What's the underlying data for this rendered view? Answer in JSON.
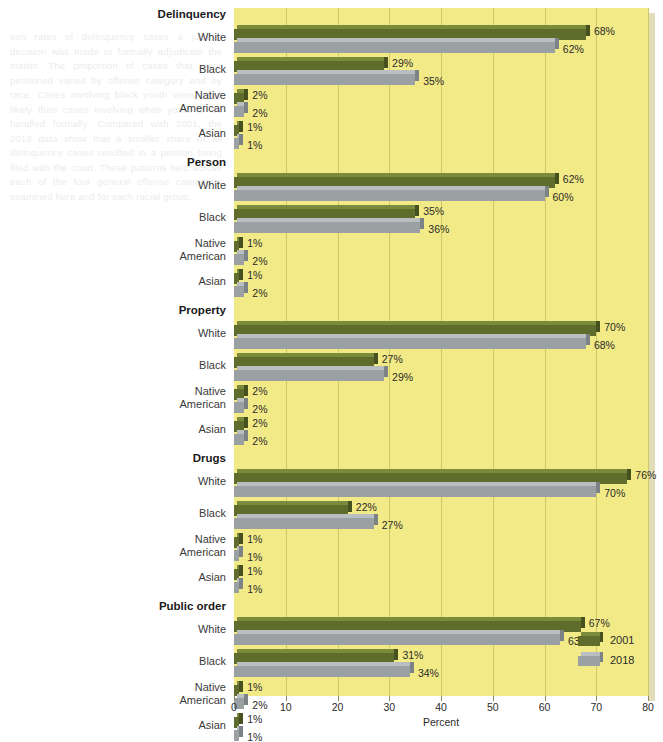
{
  "chart_data": {
    "type": "bar",
    "orientation": "horizontal",
    "title": "",
    "xlabel": "Percent",
    "ylabel": "",
    "xlim": [
      0,
      80
    ],
    "xticks": [
      0,
      10,
      20,
      30,
      40,
      50,
      60,
      70,
      80
    ],
    "xtick_labels": [
      "0",
      "10",
      "20",
      "30",
      "40",
      "50",
      "60",
      "70",
      "80"
    ],
    "grid": true,
    "grid_axis": "x",
    "legend_position": "bottom-right",
    "value_suffix": "%",
    "plot_background": "#f2ea86",
    "series": [
      {
        "name": "2001",
        "color": "#606c2b"
      },
      {
        "name": "2018",
        "color": "#9ba0a3"
      }
    ],
    "groups": [
      {
        "label": "Delinquency",
        "categories": [
          {
            "label": "White",
            "label_lines": [
              "White"
            ],
            "values": [
              68,
              62
            ],
            "value_labels": [
              "68%",
              "62%"
            ]
          },
          {
            "label": "Black",
            "label_lines": [
              "Black"
            ],
            "values": [
              29,
              35
            ],
            "value_labels": [
              "29%",
              "35%"
            ]
          },
          {
            "label": "Native American",
            "label_lines": [
              "Native",
              "American"
            ],
            "values": [
              2,
              2
            ],
            "value_labels": [
              "2%",
              "2%"
            ]
          },
          {
            "label": "Asian",
            "label_lines": [
              "Asian"
            ],
            "values": [
              1,
              1
            ],
            "value_labels": [
              "1%",
              "1%"
            ]
          }
        ]
      },
      {
        "label": "Person",
        "categories": [
          {
            "label": "White",
            "label_lines": [
              "White"
            ],
            "values": [
              62,
              60
            ],
            "value_labels": [
              "62%",
              "60%"
            ]
          },
          {
            "label": "Black",
            "label_lines": [
              "Black"
            ],
            "values": [
              35,
              36
            ],
            "value_labels": [
              "35%",
              "36%"
            ]
          },
          {
            "label": "Native American",
            "label_lines": [
              "Native",
              "American"
            ],
            "values": [
              1,
              2
            ],
            "value_labels": [
              "1%",
              "2%"
            ]
          },
          {
            "label": "Asian",
            "label_lines": [
              "Asian"
            ],
            "values": [
              1,
              2
            ],
            "value_labels": [
              "1%",
              "2%"
            ]
          }
        ]
      },
      {
        "label": "Property",
        "categories": [
          {
            "label": "White",
            "label_lines": [
              "White"
            ],
            "values": [
              70,
              68
            ],
            "value_labels": [
              "70%",
              "68%"
            ]
          },
          {
            "label": "Black",
            "label_lines": [
              "Black"
            ],
            "values": [
              27,
              29
            ],
            "value_labels": [
              "27%",
              "29%"
            ]
          },
          {
            "label": "Native American",
            "label_lines": [
              "Native",
              "American"
            ],
            "values": [
              2,
              2
            ],
            "value_labels": [
              "2%",
              "2%"
            ]
          },
          {
            "label": "Asian",
            "label_lines": [
              "Asian"
            ],
            "values": [
              2,
              2
            ],
            "value_labels": [
              "2%",
              "2%"
            ]
          }
        ]
      },
      {
        "label": "Drugs",
        "categories": [
          {
            "label": "White",
            "label_lines": [
              "White"
            ],
            "values": [
              76,
              70
            ],
            "value_labels": [
              "76%",
              "70%"
            ]
          },
          {
            "label": "Black",
            "label_lines": [
              "Black"
            ],
            "values": [
              22,
              27
            ],
            "value_labels": [
              "22%",
              "27%"
            ]
          },
          {
            "label": "Native American",
            "label_lines": [
              "Native",
              "American"
            ],
            "values": [
              1,
              1
            ],
            "value_labels": [
              "1%",
              "1%"
            ]
          },
          {
            "label": "Asian",
            "label_lines": [
              "Asian"
            ],
            "values": [
              1,
              1
            ],
            "value_labels": [
              "1%",
              "1%"
            ]
          }
        ]
      },
      {
        "label": "Public order",
        "categories": [
          {
            "label": "White",
            "label_lines": [
              "White"
            ],
            "values": [
              67,
              63
            ],
            "value_labels": [
              "67%",
              "63%"
            ]
          },
          {
            "label": "Black",
            "label_lines": [
              "Black"
            ],
            "values": [
              31,
              34
            ],
            "value_labels": [
              "31%",
              "34%"
            ]
          },
          {
            "label": "Native American",
            "label_lines": [
              "Native",
              "American"
            ],
            "values": [
              1,
              2
            ],
            "value_labels": [
              "1%",
              "2%"
            ]
          },
          {
            "label": "Asian",
            "label_lines": [
              "Asian"
            ],
            "values": [
              1,
              1
            ],
            "value_labels": [
              "1%",
              "1%"
            ]
          }
        ]
      }
    ]
  },
  "legend": {
    "entries": [
      {
        "label": "2001",
        "color": "#606c2b"
      },
      {
        "label": "2018",
        "color": "#9ba0a3"
      }
    ]
  },
  "bleed_text": {
    "left": "tion rates of delinquency cases a judicial decision was made to formally adjudicate the matter. The proportion of cases that were petitioned varied by offense category and by race. Cases involving black youth were more likely than cases involving white youth to be handled formally. Compared with 2001, the 2018 data show that a smaller share of all delinquency cases resulted in a petition being filed with the court. These patterns held across each of the four general offense categories examined here and for each racial group.",
    "right": "handled informally and those that were petitioned for formal processing. A petitioned case is one in which the prosecutor or intake officer requests a hearing before a judge or referee. Nonpetitioned cases are handled at intake without the filing of a formal charging document. Differences in the likelihood of formal handling reflect both case characteristics and jurisdictional practices, and have remained relatively stable over time."
  }
}
